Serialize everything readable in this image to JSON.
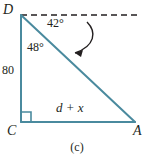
{
  "figure": {
    "caption": "(c)",
    "stroke_color": "#4a8a9e",
    "arrow_color": "#231f20",
    "text_color": "#231f20",
    "vertices": [
      {
        "name": "D",
        "label": "D",
        "x": 21,
        "y": 15
      },
      {
        "name": "C",
        "label": "C",
        "x": 21,
        "y": 122
      },
      {
        "name": "A",
        "label": "A",
        "x": 135,
        "y": 122
      }
    ],
    "angles": [
      {
        "name": "angle-at-D-from-horizontal",
        "label": "42°",
        "value": 42,
        "unit": "degrees"
      },
      {
        "name": "angle-CDA",
        "label": "48°",
        "value": 48,
        "unit": "degrees"
      },
      {
        "name": "right-angle-at-C",
        "label": "",
        "value": 90,
        "unit": "degrees"
      }
    ],
    "sides": [
      {
        "name": "DC",
        "label": "80"
      },
      {
        "name": "CA",
        "label": "d + x"
      }
    ],
    "elements": {
      "dashed_horizontal": "dashed-horizontal-line",
      "curved_arrow": "curved-arrow"
    }
  }
}
